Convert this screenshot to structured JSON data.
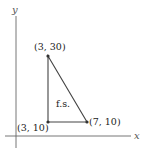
{
  "axes": {
    "x_label": "x",
    "y_label": "y"
  },
  "points": [
    {
      "label": "(3, 30)",
      "x": 3,
      "y": 30
    },
    {
      "label": "(3, 10)",
      "x": 3,
      "y": 10
    },
    {
      "label": "(7, 10)",
      "x": 7,
      "y": 10
    }
  ],
  "region_label": "f.s.",
  "colors": {
    "axis": "#555555",
    "triangle": "#444444",
    "point": "#333333"
  }
}
